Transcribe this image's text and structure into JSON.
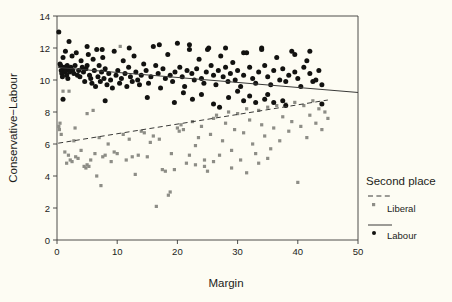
{
  "chart_data": {
    "type": "scatter",
    "title": "",
    "xlabel": "Margin",
    "ylabel": "Conservative−Labour",
    "xlim": [
      0,
      50
    ],
    "ylim": [
      0,
      14
    ],
    "xticks": [
      0,
      10,
      20,
      30,
      40,
      50
    ],
    "yticks": [
      0,
      2,
      4,
      6,
      8,
      10,
      12,
      14
    ],
    "grid": false,
    "legend": {
      "title": "Second place",
      "position": "right",
      "entries": [
        {
          "name": "Liberal",
          "marker": "square",
          "color": "#8d8d86",
          "line": "dashed"
        },
        {
          "name": "Labour",
          "marker": "circle",
          "color": "#121210",
          "line": "solid"
        }
      ]
    },
    "series": [
      {
        "name": "Labour",
        "marker": "circle",
        "color": "#121210",
        "fit_line": {
          "style": "solid",
          "x": [
            0.2,
            50.0
          ],
          "y": [
            10.78,
            9.22
          ]
        },
        "points": [
          [
            0.3,
            13.0
          ],
          [
            0.5,
            11.0
          ],
          [
            0.6,
            10.9
          ],
          [
            0.7,
            10.6
          ],
          [
            0.8,
            10.4
          ],
          [
            0.9,
            10.2
          ],
          [
            1.0,
            11.4
          ],
          [
            1.1,
            10.7
          ],
          [
            1.2,
            10.8
          ],
          [
            1.3,
            10.5
          ],
          [
            1.4,
            11.8
          ],
          [
            1.5,
            10.6
          ],
          [
            1.6,
            10.3
          ],
          [
            1.7,
            10.9
          ],
          [
            1.8,
            10.1
          ],
          [
            1.9,
            10.7
          ],
          [
            2.0,
            12.4
          ],
          [
            2.1,
            10.5
          ],
          [
            2.3,
            10.8
          ],
          [
            2.5,
            11.5
          ],
          [
            2.6,
            10.6
          ],
          [
            2.8,
            10.4
          ],
          [
            3.0,
            10.9
          ],
          [
            3.2,
            11.7
          ],
          [
            3.4,
            10.3
          ],
          [
            3.6,
            10.6
          ],
          [
            3.8,
            10.2
          ],
          [
            4.0,
            11.2
          ],
          [
            4.2,
            10.8
          ],
          [
            4.4,
            10.5
          ],
          [
            4.6,
            9.9
          ],
          [
            4.8,
            10.7
          ],
          [
            5.0,
            10.9
          ],
          [
            5.2,
            11.6
          ],
          [
            5.4,
            10.3
          ],
          [
            5.6,
            10.1
          ],
          [
            5.8,
            9.8
          ],
          [
            6.0,
            11.3
          ],
          [
            6.2,
            10.6
          ],
          [
            6.4,
            9.6
          ],
          [
            6.6,
            11.9
          ],
          [
            6.8,
            10.2
          ],
          [
            7.0,
            10.9
          ],
          [
            7.2,
            9.9
          ],
          [
            7.4,
            10.5
          ],
          [
            7.6,
            11.4
          ],
          [
            7.8,
            10.1
          ],
          [
            8.0,
            10.7
          ],
          [
            8.3,
            9.7
          ],
          [
            8.6,
            10.4
          ],
          [
            8.9,
            10.0
          ],
          [
            9.2,
            9.5
          ],
          [
            9.5,
            11.8
          ],
          [
            9.8,
            10.3
          ],
          [
            10.1,
            10.6
          ],
          [
            10.4,
            9.8
          ],
          [
            10.7,
            10.1
          ],
          [
            11.0,
            11.2
          ],
          [
            11.3,
            10.4
          ],
          [
            11.6,
            9.6
          ],
          [
            11.9,
            10.8
          ],
          [
            12.2,
            10.2
          ],
          [
            12.5,
            9.9
          ],
          [
            12.8,
            11.5
          ],
          [
            13.1,
            10.5
          ],
          [
            13.4,
            10.0
          ],
          [
            13.7,
            9.7
          ],
          [
            14.0,
            10.3
          ],
          [
            14.4,
            11.0
          ],
          [
            14.8,
            10.6
          ],
          [
            15.2,
            9.8
          ],
          [
            15.6,
            10.2
          ],
          [
            16.0,
            12.1
          ],
          [
            16.4,
            10.9
          ],
          [
            16.8,
            10.4
          ],
          [
            17.2,
            9.5
          ],
          [
            17.6,
            10.7
          ],
          [
            18.0,
            10.1
          ],
          [
            18.4,
            11.6
          ],
          [
            18.8,
            10.3
          ],
          [
            19.2,
            9.9
          ],
          [
            19.6,
            10.5
          ],
          [
            20.0,
            12.3
          ],
          [
            20.4,
            10.8
          ],
          [
            20.8,
            10.2
          ],
          [
            21.2,
            9.6
          ],
          [
            21.6,
            10.6
          ],
          [
            22.0,
            11.9
          ],
          [
            22.4,
            10.4
          ],
          [
            22.8,
            10.0
          ],
          [
            23.2,
            10.7
          ],
          [
            23.6,
            11.3
          ],
          [
            24.0,
            10.1
          ],
          [
            24.4,
            9.8
          ],
          [
            24.8,
            10.5
          ],
          [
            25.2,
            12.0
          ],
          [
            25.6,
            10.9
          ],
          [
            26.0,
            10.3
          ],
          [
            26.4,
            9.7
          ],
          [
            26.8,
            10.6
          ],
          [
            27.2,
            11.5
          ],
          [
            27.6,
            10.2
          ],
          [
            28.0,
            10.8
          ],
          [
            28.4,
            9.9
          ],
          [
            28.8,
            10.4
          ],
          [
            29.2,
            11.1
          ],
          [
            29.6,
            10.0
          ],
          [
            30.0,
            10.6
          ],
          [
            30.5,
            9.6
          ],
          [
            31.0,
            10.3
          ],
          [
            31.5,
            11.7
          ],
          [
            32.0,
            10.8
          ],
          [
            32.5,
            10.1
          ],
          [
            33.0,
            9.8
          ],
          [
            33.5,
            10.5
          ],
          [
            34.0,
            12.0
          ],
          [
            34.5,
            10.9
          ],
          [
            35.0,
            10.2
          ],
          [
            35.5,
            9.7
          ],
          [
            36.0,
            10.6
          ],
          [
            36.5,
            11.4
          ],
          [
            37.0,
            10.0
          ],
          [
            37.5,
            10.7
          ],
          [
            38.0,
            9.9
          ],
          [
            38.5,
            10.3
          ],
          [
            39.0,
            11.8
          ],
          [
            39.5,
            10.5
          ],
          [
            40.0,
            10.1
          ],
          [
            40.5,
            9.6
          ],
          [
            41.0,
            10.8
          ],
          [
            41.5,
            11.2
          ],
          [
            42.0,
            10.4
          ],
          [
            42.5,
            9.9
          ],
          [
            43.0,
            10.0
          ],
          [
            43.5,
            10.6
          ],
          [
            44.0,
            9.7
          ],
          [
            1.0,
            8.8
          ],
          [
            8.0,
            8.7
          ],
          [
            15.0,
            8.9
          ],
          [
            19.5,
            8.6
          ],
          [
            22.5,
            8.8
          ],
          [
            26.0,
            8.5
          ],
          [
            28.5,
            8.9
          ],
          [
            31.0,
            8.7
          ],
          [
            33.0,
            8.6
          ],
          [
            34.5,
            8.8
          ],
          [
            36.0,
            8.6
          ],
          [
            37.5,
            8.7
          ],
          [
            21.0,
            9.2
          ],
          [
            24.0,
            9.1
          ],
          [
            30.0,
            9.3
          ],
          [
            32.0,
            9.0
          ],
          [
            35.0,
            9.1
          ],
          [
            44.0,
            8.5
          ],
          [
            27.0,
            8.3
          ],
          [
            38.0,
            8.4
          ],
          [
            12.0,
            12.0
          ],
          [
            17.0,
            12.2
          ],
          [
            22.0,
            12.2
          ],
          [
            25.0,
            11.9
          ],
          [
            28.0,
            12.0
          ],
          [
            31.0,
            11.7
          ],
          [
            34.0,
            11.9
          ],
          [
            39.5,
            11.6
          ],
          [
            42.0,
            11.8
          ],
          [
            5.0,
            12.1
          ],
          [
            7.5,
            11.9
          ]
        ]
      },
      {
        "name": "Liberal",
        "marker": "square",
        "color": "#8d8d86",
        "fit_line": {
          "style": "dashed",
          "x": [
            0.2,
            45.0
          ],
          "y": [
            6.05,
            8.75
          ]
        },
        "points": [
          [
            0.3,
            7.1
          ],
          [
            0.4,
            6.9
          ],
          [
            0.5,
            7.3
          ],
          [
            0.7,
            6.6
          ],
          [
            1.0,
            9.3
          ],
          [
            1.3,
            5.5
          ],
          [
            1.6,
            4.8
          ],
          [
            1.9,
            5.3
          ],
          [
            2.2,
            5.0
          ],
          [
            2.5,
            4.9
          ],
          [
            2.8,
            6.2
          ],
          [
            3.1,
            5.2
          ],
          [
            3.5,
            5.1
          ],
          [
            4.0,
            5.6
          ],
          [
            4.5,
            4.6
          ],
          [
            4.8,
            4.5
          ],
          [
            5.0,
            4.7
          ],
          [
            5.3,
            4.6
          ],
          [
            5.6,
            5.0
          ],
          [
            6.0,
            8.1
          ],
          [
            6.3,
            5.4
          ],
          [
            6.6,
            4.0
          ],
          [
            7.0,
            6.4
          ],
          [
            7.3,
            3.4
          ],
          [
            7.6,
            5.2
          ],
          [
            8.0,
            5.3
          ],
          [
            8.5,
            6.0
          ],
          [
            9.0,
            4.9
          ],
          [
            9.5,
            5.5
          ],
          [
            10.0,
            5.4
          ],
          [
            10.5,
            12.1
          ],
          [
            11.0,
            6.6
          ],
          [
            11.5,
            5.0
          ],
          [
            12.0,
            6.3
          ],
          [
            12.5,
            5.2
          ],
          [
            13.0,
            4.1
          ],
          [
            13.5,
            5.3
          ],
          [
            14.0,
            6.8
          ],
          [
            14.5,
            6.7
          ],
          [
            15.0,
            5.2
          ],
          [
            15.5,
            6.1
          ],
          [
            16.0,
            6.5
          ],
          [
            16.5,
            2.1
          ],
          [
            17.0,
            6.3
          ],
          [
            17.5,
            4.4
          ],
          [
            18.0,
            4.3
          ],
          [
            18.5,
            2.8
          ],
          [
            18.8,
            3.0
          ],
          [
            19.0,
            5.4
          ],
          [
            19.5,
            4.4
          ],
          [
            20.0,
            7.0
          ],
          [
            20.3,
            6.8
          ],
          [
            20.6,
            7.2
          ],
          [
            21.0,
            6.9
          ],
          [
            21.5,
            4.8
          ],
          [
            22.0,
            5.3
          ],
          [
            22.5,
            7.4
          ],
          [
            23.0,
            5.9
          ],
          [
            23.5,
            6.4
          ],
          [
            24.0,
            7.1
          ],
          [
            24.5,
            5.0
          ],
          [
            25.0,
            4.3
          ],
          [
            25.5,
            6.6
          ],
          [
            26.0,
            7.6
          ],
          [
            26.5,
            7.8
          ],
          [
            27.0,
            5.3
          ],
          [
            27.5,
            6.2
          ],
          [
            28.0,
            7.3
          ],
          [
            28.5,
            8.0
          ],
          [
            29.0,
            5.6
          ],
          [
            29.5,
            6.9
          ],
          [
            30.0,
            7.9
          ],
          [
            30.5,
            5.0
          ],
          [
            31.0,
            6.7
          ],
          [
            31.5,
            8.2
          ],
          [
            32.0,
            7.5
          ],
          [
            32.5,
            6.0
          ],
          [
            33.0,
            5.4
          ],
          [
            33.5,
            8.1
          ],
          [
            34.0,
            7.2
          ],
          [
            34.5,
            6.5
          ],
          [
            35.0,
            8.3
          ],
          [
            35.5,
            5.7
          ],
          [
            36.0,
            7.0
          ],
          [
            36.5,
            8.4
          ],
          [
            37.0,
            6.2
          ],
          [
            37.5,
            7.7
          ],
          [
            38.0,
            8.5
          ],
          [
            38.5,
            6.8
          ],
          [
            39.0,
            7.4
          ],
          [
            39.5,
            8.6
          ],
          [
            40.0,
            3.6
          ],
          [
            40.5,
            7.1
          ],
          [
            41.0,
            8.4
          ],
          [
            41.5,
            6.4
          ],
          [
            42.0,
            7.8
          ],
          [
            42.5,
            8.7
          ],
          [
            43.0,
            7.3
          ],
          [
            43.5,
            8.2
          ],
          [
            44.0,
            6.9
          ],
          [
            44.5,
            8.0
          ],
          [
            45.0,
            7.6
          ],
          [
            5.0,
            7.9
          ],
          [
            3.0,
            7.0
          ],
          [
            23.0,
            4.7
          ],
          [
            24.5,
            4.6
          ],
          [
            26.0,
            4.9
          ],
          [
            29.0,
            4.5
          ],
          [
            31.5,
            4.2
          ],
          [
            33.5,
            4.8
          ],
          [
            35.0,
            5.1
          ],
          [
            2.0,
            9.3
          ]
        ]
      }
    ]
  },
  "axes": {
    "x_tick_labels": [
      "0",
      "10",
      "20",
      "30",
      "40",
      "50"
    ],
    "y_tick_labels": [
      "0",
      "2",
      "4",
      "6",
      "8",
      "10",
      "12",
      "14"
    ],
    "x_title": "Margin",
    "y_title": "Conservative−Labour"
  },
  "legend": {
    "title": "Second place",
    "liberal_label": "Liberal",
    "labour_label": "Labour"
  }
}
